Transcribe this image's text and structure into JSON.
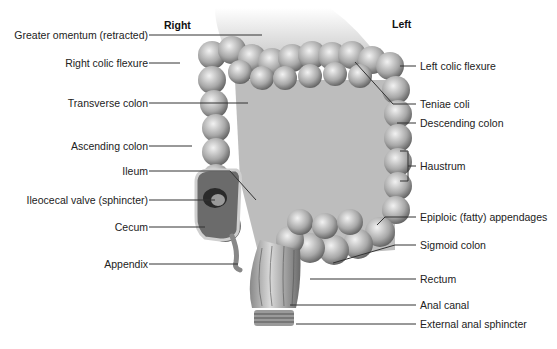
{
  "orientation": {
    "right": "Right",
    "left": "Left"
  },
  "labels_left": [
    "Greater omentum (retracted)",
    "Right colic flexure",
    "Transverse colon",
    "Ascending colon",
    "Ileum",
    "Ileocecal valve (sphincter)",
    "Cecum",
    "Appendix"
  ],
  "labels_right": [
    "Left colic flexure",
    "Teniae coli",
    "Descending colon",
    "Haustrum",
    "Epiploic (fatty) appendages",
    "Sigmoid colon",
    "Rectum",
    "Anal canal",
    "External anal sphincter"
  ]
}
